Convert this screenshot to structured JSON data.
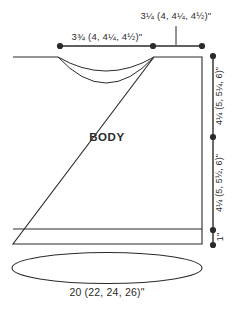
{
  "diagram": {
    "type": "knitting-pattern-schematic",
    "piece_label": "BODY",
    "measurements": {
      "shoulder_width": "3¼ (4, 4¼, 4½)\"",
      "neck_width": "3¾ (4, 4¼, 4½)\"",
      "yoke_depth": "4¼ (5, 5¼, 6)\"",
      "body_length": "4¼ (5, 5½, 6)\"",
      "ribbing_height": "1\"",
      "body_circumference": "20 (22, 24, 26)\""
    },
    "colors": {
      "line": "#2b2b2b",
      "background": "#ffffff"
    }
  }
}
